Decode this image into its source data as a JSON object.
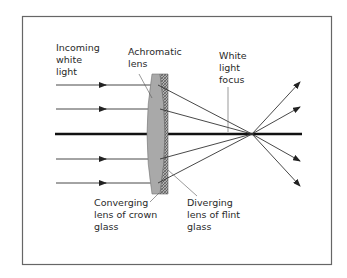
{
  "diagram": {
    "labels": {
      "incoming": [
        "Incoming",
        "white",
        "light"
      ],
      "achromatic": [
        "Achromatic",
        "lens"
      ],
      "focus": [
        "White",
        "light",
        "focus"
      ],
      "converging": [
        "Converging",
        "lens of crown",
        "glass"
      ],
      "diverging": [
        "Diverging",
        "lens of flint",
        "glass"
      ]
    },
    "colors": {
      "frame": "#555555",
      "ray": "#333333",
      "axis": "#111111",
      "crown_glass": "#a8a8a8",
      "flint_glass": "#8a8a8a",
      "text": "#2a2a2a"
    },
    "rays_incoming_y": [
      85,
      109,
      159,
      183
    ],
    "optical_axis_y": 134,
    "focus_point": [
      252,
      134
    ]
  }
}
